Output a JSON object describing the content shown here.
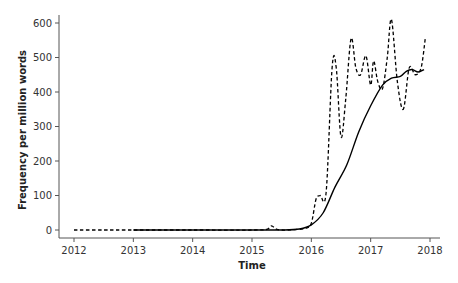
{
  "chart_data": {
    "type": "line",
    "title": "",
    "xlabel": "Time",
    "ylabel": "Frequency per million words",
    "xlim": [
      2012,
      2018
    ],
    "ylim": [
      0,
      620
    ],
    "x_ticks": [
      2012,
      2013,
      2014,
      2015,
      2016,
      2017,
      2018
    ],
    "y_ticks": [
      0,
      100,
      200,
      300,
      400,
      500,
      600
    ],
    "grid": false,
    "legend": null,
    "series": [
      {
        "name": "raw frequency",
        "style": "dashed",
        "color": "#000000",
        "x": [
          2012.0,
          2012.5,
          2013.0,
          2014.0,
          2015.0,
          2015.25,
          2015.33,
          2015.42,
          2015.6,
          2015.9,
          2016.0,
          2016.08,
          2016.15,
          2016.25,
          2016.35,
          2016.42,
          2016.5,
          2016.58,
          2016.67,
          2016.75,
          2016.83,
          2016.92,
          2017.0,
          2017.05,
          2017.12,
          2017.2,
          2017.28,
          2017.35,
          2017.45,
          2017.55,
          2017.65,
          2017.75,
          2017.85,
          2017.92
        ],
        "y": [
          0,
          0,
          0,
          0,
          0,
          2,
          12,
          2,
          0,
          5,
          20,
          90,
          100,
          110,
          470,
          470,
          270,
          380,
          555,
          470,
          450,
          505,
          420,
          490,
          430,
          410,
          500,
          610,
          430,
          350,
          470,
          450,
          470,
          555
        ]
      },
      {
        "name": "smoothed trend",
        "style": "solid",
        "color": "#000000",
        "x": [
          2013.0,
          2014.0,
          2015.0,
          2015.5,
          2015.8,
          2016.0,
          2016.2,
          2016.4,
          2016.6,
          2016.8,
          2017.0,
          2017.2,
          2017.35,
          2017.5,
          2017.6,
          2017.7,
          2017.8,
          2017.9
        ],
        "y": [
          0,
          0,
          0,
          0,
          3,
          15,
          50,
          125,
          190,
          285,
          360,
          420,
          440,
          445,
          460,
          465,
          458,
          465
        ]
      }
    ]
  }
}
